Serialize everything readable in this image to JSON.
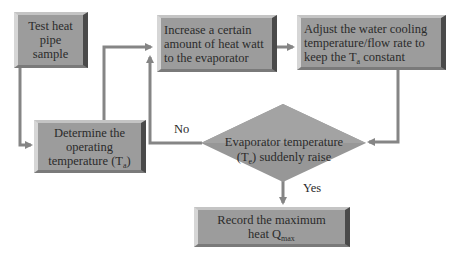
{
  "diagram": {
    "type": "flowchart",
    "colors": {
      "box_fill": "#9c9c9c",
      "box_highlight": "#d6d6d6",
      "box_shadow": "#4a4a4a",
      "arrow": "#858585",
      "text": "#2b2b2b",
      "background": "#ffffff"
    },
    "nodes": [
      {
        "id": "n1",
        "shape": "rect",
        "text": "Test heat pipe sample"
      },
      {
        "id": "n2",
        "shape": "rect",
        "text_line1": "Increase a certain",
        "text_line2": "amount of heat watt",
        "text_line3": "to the evaporator"
      },
      {
        "id": "n3",
        "shape": "rect",
        "text_line1": "Adjust the water cooling",
        "text_line2": "temperature/flow rate to",
        "text_line3_pre": "keep the T",
        "text_line3_sub": "a",
        "text_line3_post": " constant"
      },
      {
        "id": "n4",
        "shape": "rect",
        "text_line1": "Determine the",
        "text_line2": "operating",
        "text_line3_pre": "temperature (T",
        "text_line3_sub": "a",
        "text_line3_post": ")"
      },
      {
        "id": "n5",
        "shape": "diamond",
        "text_line1": "Evaporator temperature",
        "text_line2_pre": "(T",
        "text_line2_sub": "e",
        "text_line2_post": ") suddenly raise"
      },
      {
        "id": "n6",
        "shape": "rect",
        "text_line1": "Record the maximum",
        "text_line2_pre": "heat Q",
        "text_line2_sub": "max"
      }
    ],
    "edges": [
      {
        "from": "n1",
        "to": "n4",
        "label": ""
      },
      {
        "from": "n4",
        "to": "n2",
        "label": ""
      },
      {
        "from": "n2",
        "to": "n3",
        "label": ""
      },
      {
        "from": "n3",
        "to": "n5",
        "label": ""
      },
      {
        "from": "n5",
        "to": "n2",
        "label": "No"
      },
      {
        "from": "n5",
        "to": "n6",
        "label": "Yes"
      }
    ],
    "labels": {
      "no": "No",
      "yes": "Yes"
    }
  }
}
